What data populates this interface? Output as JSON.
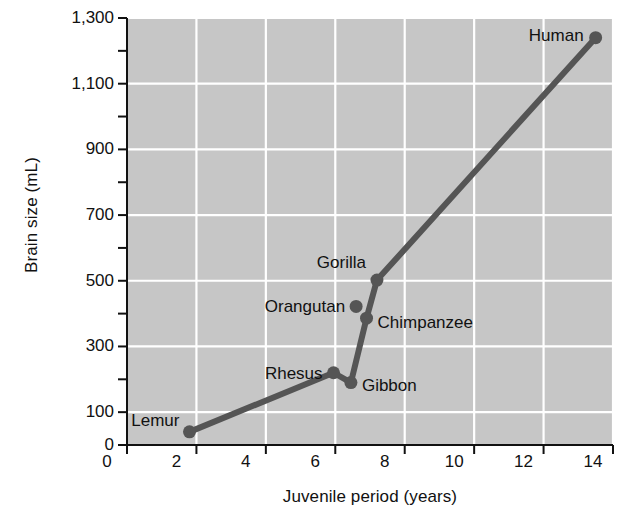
{
  "chart_data": {
    "type": "line",
    "title": "",
    "xlabel": "Juvenile period (years)",
    "ylabel": "Brain size (mL)",
    "xlim": [
      0,
      14
    ],
    "ylim": [
      0,
      1300
    ],
    "xticks": [
      0,
      2,
      4,
      6,
      8,
      10,
      12,
      14
    ],
    "xtick_labels": [
      "0",
      "2",
      "4",
      "6",
      "8",
      "10",
      "12",
      "14"
    ],
    "yticks": [
      0,
      100,
      300,
      500,
      700,
      900,
      1100,
      1300
    ],
    "ytick_labels": [
      "0",
      "100",
      "300",
      "500",
      "700",
      "900",
      "1,100",
      "1,300"
    ],
    "y_minor_ticks": [
      200,
      400,
      600,
      800,
      1000,
      1200
    ],
    "grid": true,
    "grid_color": "#ffffff",
    "plot_bg_color": "#c6c6c6",
    "line_color": "#555555",
    "marker_color": "#555555",
    "text_color": "#111111",
    "points": [
      {
        "label": "Lemur",
        "x": 1.8,
        "y": 40,
        "label_side": "left",
        "label_dx": -10,
        "label_dy": -12
      },
      {
        "label": "Rhesus",
        "x": 5.95,
        "y": 220,
        "label_side": "left",
        "label_dx": -11,
        "label_dy": 0
      },
      {
        "label": "Gibbon",
        "x": 6.45,
        "y": 190,
        "label_side": "right",
        "label_dx": 11,
        "label_dy": 2
      },
      {
        "label": "Orangutan",
        "x": 6.6,
        "y": 422,
        "label_side": "left",
        "label_dx": -11,
        "label_dy": 0
      },
      {
        "label": "Chimpanzee",
        "x": 6.9,
        "y": 386,
        "label_side": "right",
        "label_dx": 11,
        "label_dy": 4
      },
      {
        "label": "Gorilla",
        "x": 7.2,
        "y": 502,
        "label_side": "left",
        "label_dx": -11,
        "label_dy": -18
      },
      {
        "label": "Human",
        "x": 13.5,
        "y": 1240,
        "label_side": "left",
        "label_dx": -12,
        "label_dy": -3
      }
    ],
    "line_series": {
      "name": "Brain size vs juvenile period",
      "x": [
        1.8,
        5.95,
        6.45,
        6.9,
        7.2,
        13.5
      ],
      "y": [
        40,
        220,
        190,
        386,
        502,
        1240
      ]
    },
    "series_note": "Line connects Lemur -> Rhesus -> (dip to Gibbon level) -> Chimpanzee -> Gorilla -> Human"
  }
}
